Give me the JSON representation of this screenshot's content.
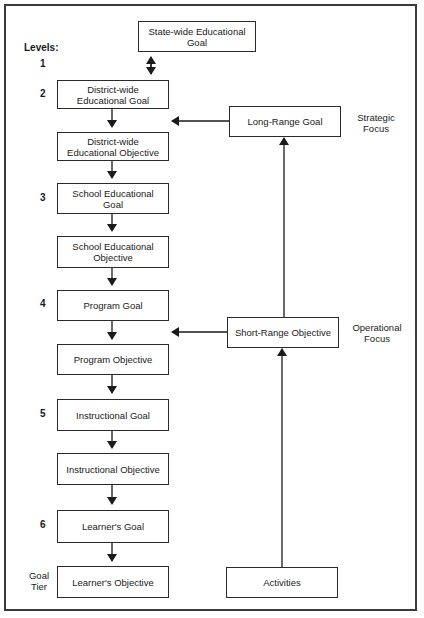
{
  "diagram": {
    "levels_heading": "Levels:",
    "goal_tier_label": "Goal\nTier",
    "levels": [
      {
        "number": "1"
      },
      {
        "number": "2"
      },
      {
        "number": "3"
      },
      {
        "number": "4"
      },
      {
        "number": "5"
      },
      {
        "number": "6"
      }
    ],
    "top_box": "State-wide Educational Goal",
    "left_column": [
      "District-wide Educational Goal",
      "District-wide Educational Objective",
      "School Educational Goal",
      "School Educational Objective",
      "Program Goal",
      "Program Objective",
      "Instructional Goal",
      "Instructional Objective",
      "Learner's Goal",
      "Learner's Objective"
    ],
    "right_column": {
      "long_range": "Long-Range Goal",
      "short_range": "Short-Range Objective",
      "activities": "Activities"
    },
    "focus_labels": {
      "strategic": "Strategic Focus",
      "operational": "Operational Focus"
    }
  }
}
